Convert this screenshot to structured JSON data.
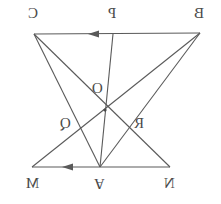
{
  "figure": {
    "canvas": {
      "width": 221,
      "height": 204
    },
    "stroke_color": "#5a5a5a",
    "label_color": "#4a4a4a",
    "background_color": "#ffffff"
  },
  "points": {
    "C": {
      "label": "C",
      "x": 34,
      "y": 34
    },
    "P": {
      "label": "P",
      "x": 113,
      "y": 34
    },
    "B": {
      "label": "B",
      "x": 200,
      "y": 33
    },
    "O": {
      "label": "O",
      "x": 105,
      "y": 110
    },
    "Q": {
      "label": "Q",
      "x": 76,
      "y": 137
    },
    "R": {
      "label": "R",
      "x": 130,
      "y": 137
    },
    "M": {
      "label": "M",
      "x": 32,
      "y": 167
    },
    "A": {
      "label": "A",
      "x": 100,
      "y": 167
    },
    "N": {
      "label": "N",
      "x": 170,
      "y": 167
    }
  },
  "labels": [
    {
      "name": "label-C",
      "text": "C",
      "left": 28,
      "top": 6,
      "flip": "x"
    },
    {
      "name": "label-P",
      "text": "P",
      "left": 108,
      "top": 6,
      "flip": "x"
    },
    {
      "name": "label-B",
      "text": "B",
      "left": 194,
      "top": 6,
      "flip": "x"
    },
    {
      "name": "label-O",
      "text": "O",
      "left": 92,
      "top": 81,
      "flip": "x"
    },
    {
      "name": "label-Q",
      "text": "Q",
      "left": 60,
      "top": 116,
      "flip": "x"
    },
    {
      "name": "label-R",
      "text": "R",
      "left": 134,
      "top": 116,
      "flip": "x"
    },
    {
      "name": "label-M",
      "text": "M",
      "left": 26,
      "top": 176,
      "flip": "x"
    },
    {
      "name": "label-A",
      "text": "A",
      "left": 94,
      "top": 176,
      "flip": "both"
    },
    {
      "name": "label-N",
      "text": "N",
      "left": 164,
      "top": 176,
      "flip": "x"
    }
  ],
  "segments": [
    {
      "name": "segment-BC-top",
      "from": "B",
      "to": "C",
      "arrow": "left",
      "arrow_at_x": 98,
      "arrow_at_y": 34
    },
    {
      "name": "segment-NM-bottom",
      "from": "N",
      "to": "M",
      "arrow": "left",
      "arrow_at_x": 72,
      "arrow_at_y": 167
    },
    {
      "name": "segment-PA-vertical",
      "from": "P",
      "to": "A",
      "arrow": "none"
    },
    {
      "name": "segment-CA",
      "from": "C",
      "to": "A",
      "arrow": "none"
    },
    {
      "name": "segment-CN",
      "from": "C",
      "to": "N",
      "arrow": "none"
    },
    {
      "name": "segment-BA",
      "from": "B",
      "to": "A",
      "arrow": "none"
    },
    {
      "name": "segment-BM",
      "from": "B",
      "to": "M",
      "arrow": "none"
    }
  ]
}
